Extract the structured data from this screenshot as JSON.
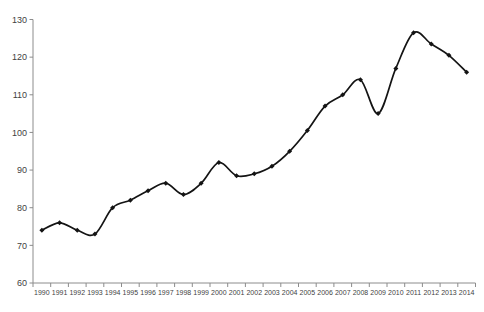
{
  "chart_data": {
    "type": "line",
    "title": "",
    "xlabel": "",
    "ylabel": "",
    "categories": [
      "1990",
      "1991",
      "1992",
      "1993",
      "1994",
      "1995",
      "1996",
      "1997",
      "1998",
      "1999",
      "2000",
      "2001",
      "2002",
      "2003",
      "2004",
      "2005",
      "2006",
      "2007",
      "2008",
      "2009",
      "2010",
      "2011",
      "2012",
      "2013",
      "2014"
    ],
    "series": [
      {
        "name": "index",
        "values": [
          74,
          76,
          74,
          73,
          80,
          82,
          84.5,
          86.5,
          83.5,
          86.5,
          92,
          88.5,
          89,
          91,
          95,
          100.5,
          107,
          110,
          114,
          105,
          117,
          126.5,
          123.5,
          120.5,
          116
        ]
      }
    ],
    "ylim": [
      60,
      130
    ],
    "yticks": [
      60,
      70,
      80,
      90,
      100,
      110,
      120,
      130
    ],
    "ytick_step": 10,
    "x_ticks_between_categories": true,
    "grid": false,
    "legend_position": "none",
    "smooth_line": true,
    "marker": "diamond",
    "line_color": "#141414",
    "marker_color": "#141414",
    "axis_color": "#8c8c8c",
    "tick_label_color": "#3f3f3f",
    "background_color": "#ffffff"
  }
}
